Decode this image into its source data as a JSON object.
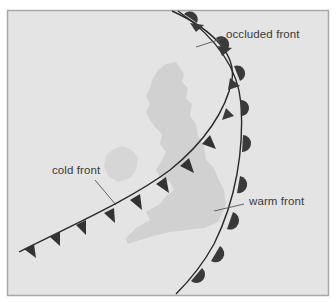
{
  "diagram": {
    "colors": {
      "background": "#e4e4e4",
      "frame_border": "#a9a9a9",
      "landmass": "#d2d2d2",
      "front_line": "#2a2a2a",
      "symbol_fill": "#3c3c3c",
      "label_text": "#3a3a3a",
      "leader_line": "#555555"
    },
    "labels": {
      "occluded_front": "occluded front",
      "cold_front": "cold front",
      "warm_front": "warm front"
    },
    "fronts": [
      {
        "name": "cold front",
        "symbol": "triangles"
      },
      {
        "name": "warm front",
        "symbol": "semicircles"
      },
      {
        "name": "occluded front",
        "symbol": "alternating triangles and semicircles"
      }
    ]
  }
}
